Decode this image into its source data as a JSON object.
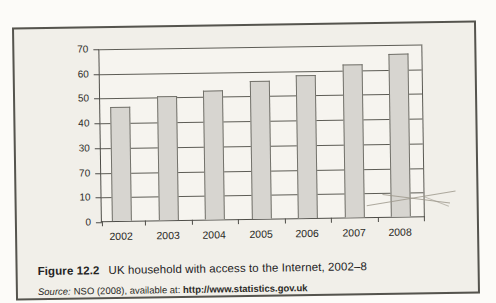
{
  "figure": {
    "caption_label": "Figure 12.2",
    "caption_title": "UK household with access to the Internet, 2002–8",
    "source_prefix": "Source:",
    "source_text": "NSO (2008), available at: ",
    "source_link": "http://www.statistics.gov.uk"
  },
  "chart_data": {
    "type": "bar",
    "title": "",
    "xlabel": "",
    "ylabel": "",
    "categories": [
      "2002",
      "2003",
      "2004",
      "2005",
      "2006",
      "2007",
      "2008"
    ],
    "values": [
      46,
      50,
      52,
      56,
      58,
      62,
      66
    ],
    "ylim": [
      0,
      70
    ],
    "ytick_step": 10,
    "ytick_labels_top_to_bottom": [
      "70",
      "60",
      "50",
      "40",
      "30",
      "70",
      "10",
      "0"
    ],
    "grid": "horizontal",
    "legend": "none",
    "bar_fill": "#d7d5d0",
    "bar_border": "#73726b",
    "plot_background": "#f6f4ef",
    "box_background": "#f1efe9"
  }
}
